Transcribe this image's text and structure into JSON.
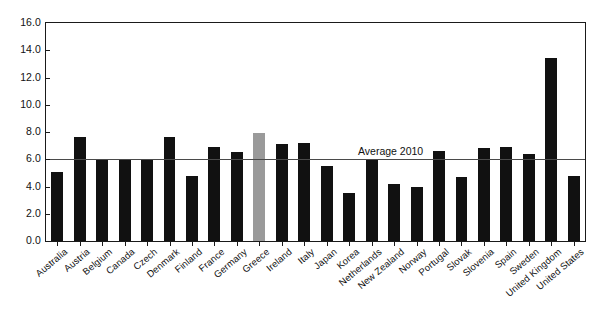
{
  "chart_data": {
    "type": "bar",
    "title": "",
    "xlabel": "",
    "ylabel": "",
    "ylim": [
      0.0,
      16.0
    ],
    "ytick_step": 2.0,
    "ytick_labels": [
      "16.0",
      "14.0",
      "12.0",
      "10.0",
      "8.0",
      "6.0",
      "4.0",
      "2.0",
      "0.0"
    ],
    "ytick_values": [
      16.0,
      14.0,
      12.0,
      10.0,
      8.0,
      6.0,
      4.0,
      2.0,
      0.0
    ],
    "grid": false,
    "legend": "none",
    "bar_color": "#111111",
    "highlight_color": "#9a9a9a",
    "highlight_category": "Greece",
    "annotations": [
      {
        "name": "average-line",
        "label": "Average 2010",
        "value": 6.0,
        "type": "hline",
        "color": "#4a4a4a"
      }
    ],
    "categories": [
      "Australia",
      "Austria",
      "Belgium",
      "Canada",
      "Czech",
      "Denmark",
      "Finland",
      "France",
      "Germany",
      "Greece",
      "Ireland",
      "Italy",
      "Japan",
      "Korea",
      "Netherlands",
      "New Zealand",
      "Norway",
      "Portugal",
      "Slovak",
      "Slovenia",
      "Spain",
      "Sweden",
      "United Kingdom",
      "United States"
    ],
    "values": [
      5.1,
      7.6,
      6.0,
      6.0,
      6.0,
      7.6,
      4.8,
      6.9,
      6.5,
      7.9,
      7.1,
      7.2,
      5.5,
      3.5,
      6.0,
      4.2,
      4.0,
      6.6,
      4.7,
      6.8,
      6.9,
      6.4,
      13.4,
      4.8
    ]
  }
}
